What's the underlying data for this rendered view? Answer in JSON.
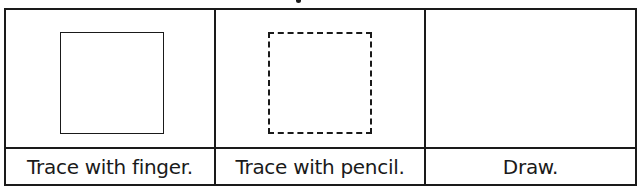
{
  "worksheet": {
    "columns": [
      {
        "shape": "solid-square",
        "label": "Trace with finger."
      },
      {
        "shape": "dashed-square",
        "label": "Trace with pencil."
      },
      {
        "shape": "none",
        "label": "Draw."
      }
    ]
  },
  "colors": {
    "line": "#1a1a1a",
    "background": "#ffffff"
  }
}
